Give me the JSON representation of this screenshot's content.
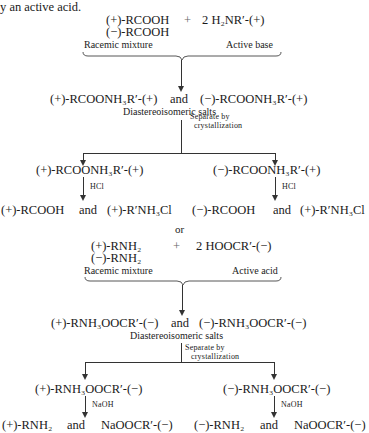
{
  "intro": {
    "text": "y an active acid."
  },
  "scheme1": {
    "reactant_plus": "(+)-RCOOH",
    "reactant_minus": "(−)-RCOOH",
    "plus_sign": "+",
    "reagent": "2 H₂NR′-(+)",
    "label_racemic": "Racemic mixture",
    "label_active": "Active base",
    "salts_left": "(+)-RCOONH₃R′-(+)",
    "and": "and",
    "salts_right": "(−)-RCOONH₃R′-(+)",
    "salts_label": "Diastereoisomeric salts",
    "separate_1": "Separate by",
    "separate_2": "crystallization",
    "branch_left": "(+)-RCOONH₃R′-(+)",
    "branch_right": "(−)-RCOONH₃R′-(+)",
    "reagent_left": "HCl",
    "reagent_right": "HCl",
    "product_left_a": "(+)-RCOOH",
    "product_left_and": "and",
    "product_left_b": "(+)-R′NH₃Cl",
    "product_right_a": "(−)-RCOOH",
    "product_right_and": "and",
    "product_right_b": "(+)-R′NH₃Cl"
  },
  "or_text": "or",
  "scheme2": {
    "reactant_plus": "(+)-RNH₂",
    "reactant_minus": "(−)-RNH₂",
    "plus_sign": "+",
    "reagent": "2 HOOCR′-(−)",
    "label_racemic": "Racemic mixture",
    "label_active": "Active acid",
    "salts_left": "(+)-RNH₃OOCR′-(−)",
    "and": "and",
    "salts_right": "(−)-RNH₃OOCR′-(−)",
    "salts_label": "Diastereoisomeric salts",
    "separate_1": "Separate by",
    "separate_2": "crystallization",
    "branch_left": "(+)-RNH₃OOCR′-(−)",
    "branch_right": "(−)-RNH₃OOCR′-(−)",
    "reagent_left": "NaOH",
    "reagent_right": "NaOH",
    "product_left_a": "(+)-RNH₂",
    "product_left_and": "and",
    "product_left_b": "NaOOCR′-(−)",
    "product_right_a": "(−)-RNH₂",
    "product_right_and": "and",
    "product_right_b": "NaOOCR′-(−)"
  }
}
